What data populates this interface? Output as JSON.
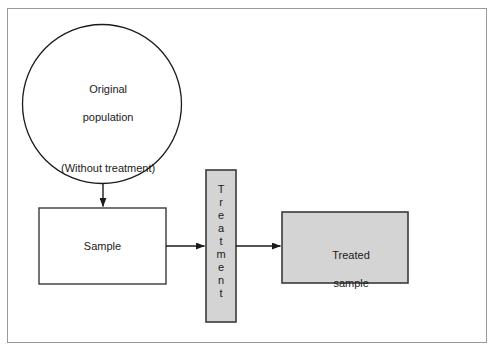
{
  "diagram": {
    "colors": {
      "frame_border": "#9a9a9a",
      "shape_stroke": "#1b1b1b",
      "fill_white": "#ffffff",
      "fill_gray": "#d4d4d4",
      "text": "#1b1b1b"
    },
    "nodes": {
      "population": {
        "shape": "circle",
        "line1": "Original",
        "line2": "population",
        "line3": "(Without treatment)"
      },
      "sample": {
        "shape": "rectangle",
        "label": "Sample"
      },
      "treatment": {
        "shape": "vertical-bar",
        "label": "Treatment",
        "letters": [
          "T",
          "r",
          "e",
          "a",
          "t",
          "m",
          "e",
          "n",
          "t"
        ]
      },
      "treated_sample": {
        "shape": "rectangle",
        "line1": "Treated",
        "line2": "sample"
      }
    },
    "edges": [
      {
        "name": "population-to-sample",
        "direction": "down"
      },
      {
        "name": "sample-to-treatment",
        "direction": "right"
      },
      {
        "name": "treatment-to-treated-sample",
        "direction": "right"
      }
    ]
  }
}
